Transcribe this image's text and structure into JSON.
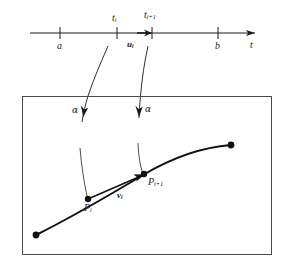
{
  "figure": {
    "caption": "",
    "colors": {
      "ink": "#1a1a1a",
      "line": "#404040",
      "box": "#555555",
      "background": "#ffffff"
    },
    "axis": {
      "variable_label": "t",
      "ticks": [
        {
          "name": "a",
          "label": "a",
          "x": 60
        },
        {
          "name": "t-i",
          "label": "t",
          "sub": "i",
          "x": 117
        },
        {
          "name": "t-i-plus-1",
          "label": "t",
          "sub": "i+1",
          "x": 152
        },
        {
          "name": "b",
          "label": "b",
          "x": 218
        }
      ],
      "sample_point": {
        "label": "u",
        "sub": "i",
        "x": 140
      }
    },
    "map": {
      "left_arrow_label": "α",
      "right_arrow_label": "α"
    },
    "curve": {
      "start_point": {
        "name": "curve-start-dot"
      },
      "end_point": {
        "name": "curve-end-dot"
      },
      "points": [
        {
          "name": "P-i",
          "label": "P",
          "sub": "i"
        },
        {
          "name": "P-i-plus-1",
          "label": "P",
          "sub": "i+1"
        }
      ],
      "vector": {
        "label": "v",
        "sub": "i"
      }
    }
  }
}
